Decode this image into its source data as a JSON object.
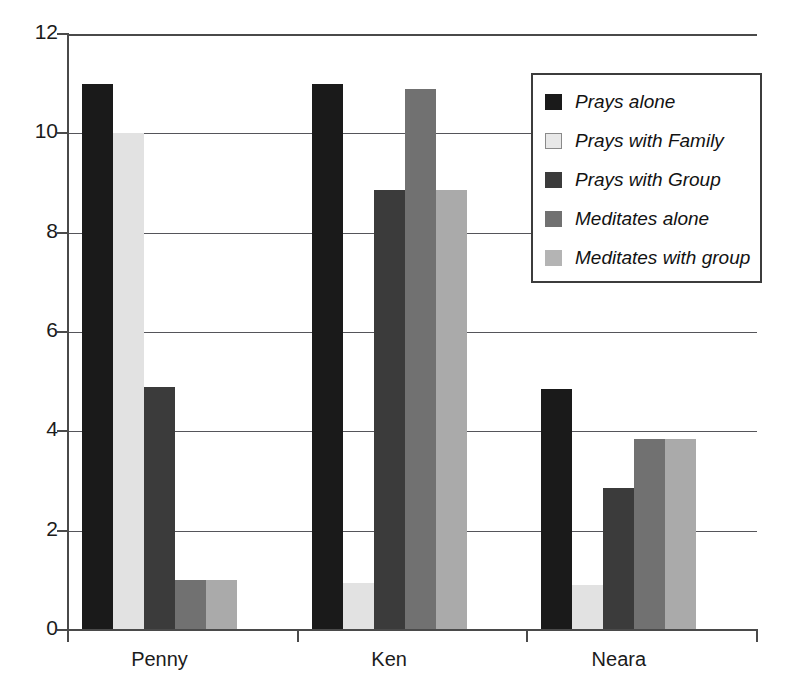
{
  "chart_data": {
    "type": "bar",
    "title": "",
    "xlabel": "",
    "ylabel": "",
    "categories": [
      "Penny",
      "Ken",
      "Neara"
    ],
    "ylim": [
      0,
      12
    ],
    "yticks": [
      0,
      2,
      4,
      6,
      8,
      10,
      12
    ],
    "grid": true,
    "legend_position": "top-right",
    "series": [
      {
        "name": "Prays alone",
        "color": "#1a1a1a",
        "values": [
          11.0,
          11.0,
          4.85
        ]
      },
      {
        "name": "Prays with Family",
        "color": "#e2e2e2",
        "values": [
          10.0,
          0.95,
          0.9
        ]
      },
      {
        "name": "Prays with Group",
        "color": "#3b3b3b",
        "values": [
          4.9,
          8.85,
          2.85
        ]
      },
      {
        "name": "Meditates alone",
        "color": "#717171",
        "values": [
          1.0,
          10.9,
          3.85
        ]
      },
      {
        "name": "Meditates with group",
        "color": "#aaaaaa",
        "values": [
          1.0,
          8.85,
          3.85
        ]
      }
    ]
  },
  "axis": {
    "y_tick_labels": [
      "0",
      "2",
      "4",
      "6",
      "8",
      "10",
      "12"
    ],
    "x_tick_labels": [
      "Penny",
      "Ken",
      "Neara"
    ]
  },
  "legend": {
    "items": [
      {
        "label": "Prays alone",
        "swatch": "#1a1a1a"
      },
      {
        "label": "Prays with Family",
        "swatch": "#e8e8e8"
      },
      {
        "label": "Prays with Group",
        "swatch": "#3b3b3b"
      },
      {
        "label": "Meditates alone",
        "swatch": "#717171"
      },
      {
        "label": "Meditates with group",
        "swatch": "#b4b4b4"
      }
    ]
  }
}
